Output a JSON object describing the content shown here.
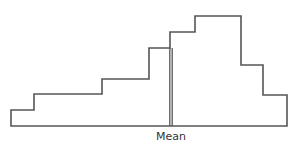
{
  "chart_data": {
    "type": "bar",
    "subtype": "histogram",
    "title": "",
    "xlabel": "",
    "ylabel": "",
    "grid": false,
    "legend": null,
    "bins": [
      1,
      2,
      3,
      4,
      5,
      6,
      7,
      8
    ],
    "values": [
      1,
      2,
      3,
      5,
      6,
      7,
      4,
      2
    ],
    "bin_edges_px": [
      11,
      34,
      102,
      149,
      170,
      195,
      241,
      263,
      287
    ],
    "bar_tops_px": [
      110,
      94,
      79,
      48,
      32,
      16,
      65,
      95
    ],
    "baseline_px": 126,
    "annotations": [
      {
        "type": "vline",
        "label": "Mean",
        "x_px": 171
      }
    ]
  },
  "labels": {
    "mean": "Mean"
  },
  "colors": {
    "line": "#555555",
    "background": "#ffffff"
  }
}
